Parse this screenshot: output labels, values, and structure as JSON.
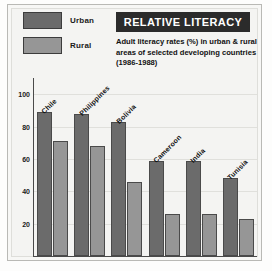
{
  "header": {
    "title": "RELATIVE LITERACY",
    "subtitle": "Adult literacy rates (%) in urban & rural areas of selected developing countries (1986-1988)"
  },
  "legend": {
    "position": "top-left",
    "items": [
      {
        "label": "Urban",
        "color": "#6b6b6b"
      },
      {
        "label": "Rural",
        "color": "#969696"
      }
    ]
  },
  "colors": {
    "urban": "#6b6b6b",
    "rural": "#969696",
    "banner_background": "#2b2b2b",
    "banner_text": "#ffffff",
    "plot_background": "#f4f4f2",
    "axis": "#4a4a4a",
    "gridline": "#e0e0dc"
  },
  "chart_data": {
    "type": "bar",
    "title": "RELATIVE LITERACY",
    "subtitle": "Adult literacy rates (%) in urban & rural areas of selected developing countries (1986-1988)",
    "xlabel": "",
    "ylabel": "",
    "ylim": [
      0,
      110
    ],
    "yticks": [
      20,
      40,
      60,
      80,
      100
    ],
    "ytick_labels": [
      "20",
      "40",
      "60",
      "80",
      "100"
    ],
    "grid": true,
    "legend_position": "top-left",
    "categories": [
      "Chile",
      "Philippines",
      "Bolivia",
      "Cameroon",
      "India",
      "Tunisia"
    ],
    "series": [
      {
        "name": "Urban",
        "values": [
          89,
          88,
          83,
          59,
          59,
          48
        ]
      },
      {
        "name": "Rural",
        "values": [
          71,
          68,
          46,
          26,
          26,
          23
        ]
      }
    ]
  }
}
